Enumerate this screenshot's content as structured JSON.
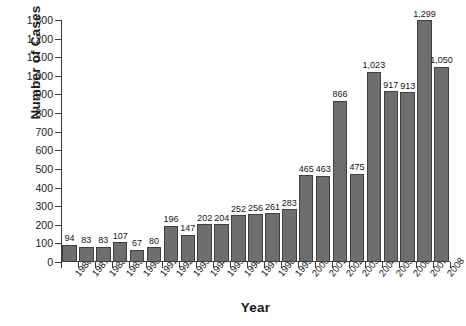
{
  "chart_data": {
    "type": "bar",
    "title": "",
    "xlabel": "Year",
    "ylabel": "Number of Cases",
    "categories": [
      "1986",
      "1987",
      "1988",
      "1989",
      "1990",
      "1991",
      "1992",
      "1993",
      "1994",
      "1995",
      "1996",
      "1997",
      "1998",
      "1999",
      "2000",
      "2001",
      "2002",
      "2003",
      "2004",
      "2005",
      "2006",
      "2007",
      "2008"
    ],
    "values": [
      94,
      83,
      83,
      107,
      67,
      80,
      196,
      147,
      202,
      204,
      252,
      256,
      261,
      283,
      465,
      463,
      866,
      475,
      1023,
      917,
      913,
      1299,
      1050
    ],
    "value_labels": [
      "94",
      "83",
      "83",
      "107",
      "67",
      "80",
      "196",
      "147",
      "202",
      "204",
      "252",
      "256",
      "261",
      "283",
      "465",
      "463",
      "866",
      "475",
      "1,023",
      "917",
      "913",
      "1,299",
      "1,050"
    ],
    "ylim": [
      0,
      1300
    ],
    "ytick_values": [
      0,
      100,
      200,
      300,
      400,
      500,
      600,
      700,
      800,
      900,
      1000,
      1100,
      1200,
      1300
    ],
    "ytick_labels": [
      "0",
      "100",
      "200",
      "300",
      "400",
      "500",
      "600",
      "700",
      "800",
      "900",
      "1,000",
      "1,100",
      "1,200",
      "1,300"
    ],
    "grid": false,
    "legend": "none",
    "bar_color": "#6e6e6e",
    "bar_edge_color": "#3f3f3f",
    "axis_color": "#3a3a3a"
  }
}
